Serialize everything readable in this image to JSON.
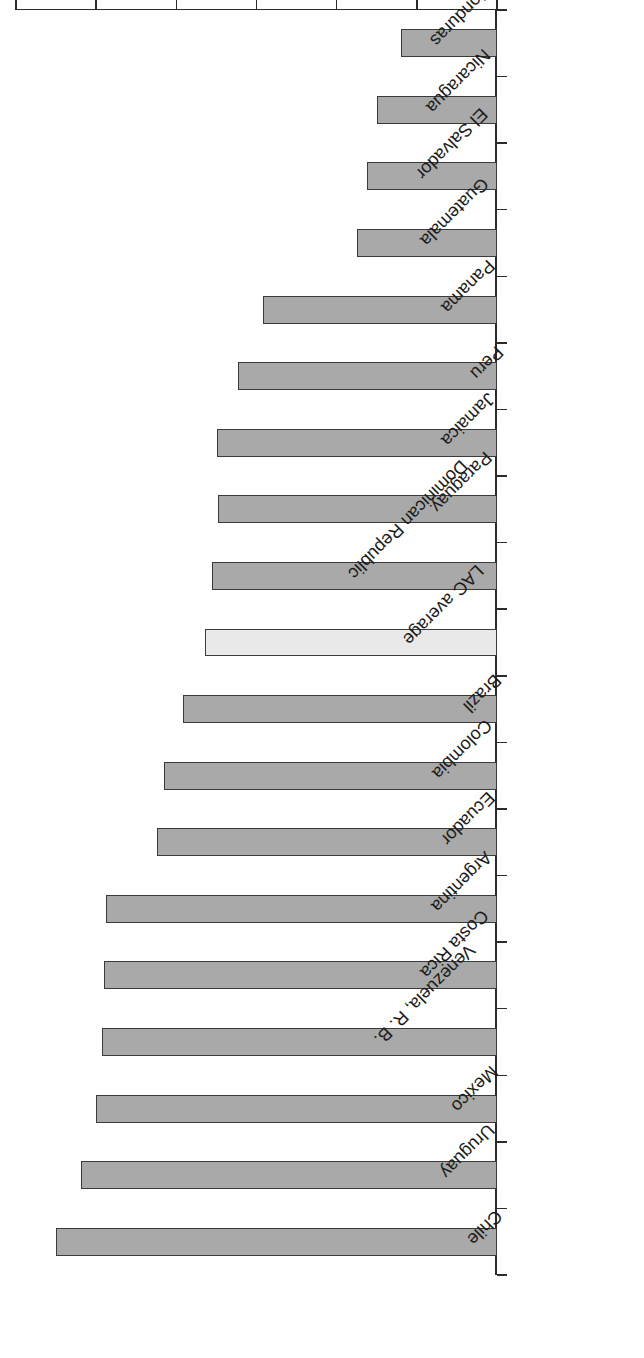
{
  "chart_data": {
    "type": "bar",
    "orientation": "horizontal",
    "title": "",
    "subtitle": "",
    "xlabel": "HOI 2010 (%)",
    "ylabel": "",
    "xlim": [
      40,
      100
    ],
    "xticks": [
      40,
      50,
      60,
      70,
      80,
      90,
      100
    ],
    "xtick_labels": [
      "40",
      "50",
      "60",
      "70",
      "80",
      "90",
      "100"
    ],
    "grid": false,
    "legend": null,
    "rotation_note": "figure printed upside down (180 degrees)",
    "categories": [
      "Chile",
      "Uruguay",
      "Mexico",
      "Venezuela, R. B.",
      "Costa Rica",
      "Argentina",
      "Ecuador",
      "Colombia",
      "Brazil",
      "LAC average",
      "Dominican Republic",
      "Paraguay",
      "Jamaica",
      "Peru",
      "Panama",
      "Guatemala",
      "El Salvador",
      "Nicaragua",
      "Honduras"
    ],
    "values": [
      95.0,
      91.9,
      90.0,
      89.3,
      89.0,
      88.8,
      82.4,
      81.5,
      79.2,
      76.4,
      75.6,
      74.8,
      74.9,
      72.3,
      69.2,
      57.5,
      56.2,
      55.0,
      52.0
    ],
    "highlight_category": "LAC average",
    "colors": {
      "bar_fill": "#a9a9a9",
      "bar_border": "#3a3a3a",
      "highlight_fill": "#e9e9e9",
      "axis": "#2b2b2b",
      "text": "#1c1c1c",
      "background": "#ffffff"
    }
  }
}
